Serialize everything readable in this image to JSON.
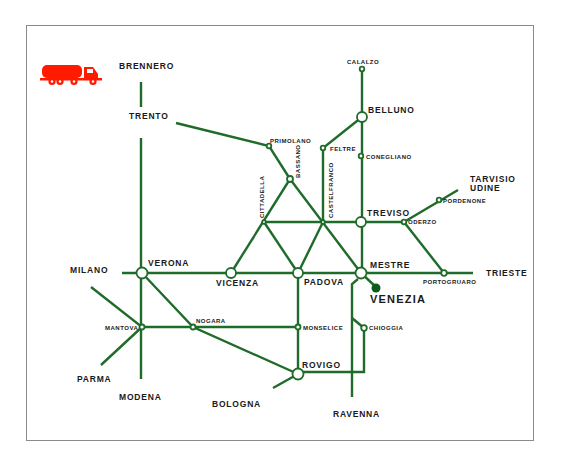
{
  "colors": {
    "line": "#1f6b2a",
    "station_fill": "#ffffff",
    "venezia_dot": "#0f5a1d",
    "truck": "#ff1a00",
    "frame": "#8a8a8a",
    "text": "#1a1a1a"
  },
  "legend": {
    "icon": "truck-icon"
  },
  "cities": {
    "brennero": "BRENNERO",
    "trento": "TRENTO",
    "milano": "MILANO",
    "verona": "VERONA",
    "vicenza": "VICENZA",
    "padova": "PADOVA",
    "mestre": "MESTRE",
    "venezia": "VENEZIA",
    "treviso": "TREVISO",
    "belluno": "BELLUNO",
    "trieste": "TRIESTE",
    "tarvisio": "TARVISIO",
    "udine": "UDINE",
    "rovigo": "ROVIGO",
    "parma": "PARMA",
    "modena": "MODENA",
    "bologna": "BOLOGNA",
    "ravenna": "RAVENNA"
  },
  "towns": {
    "calalzo": "CALALZO",
    "primolano": "PRIMOLANO",
    "feltre": "FELTRE",
    "conegliano": "CONEGLIANO",
    "bassano": "BASSANO",
    "cittadella": "CITTADELLA",
    "castelfranco": "CASTELFRANCO",
    "oderzo": "ODERZO",
    "pordenone": "PORDENONE",
    "portogruaro": "PORTOGRUARO",
    "mantova": "MANTOVA",
    "nogara": "NOGARA",
    "monselice": "MONSELICE",
    "chioggia": "CHIOGGIA"
  }
}
